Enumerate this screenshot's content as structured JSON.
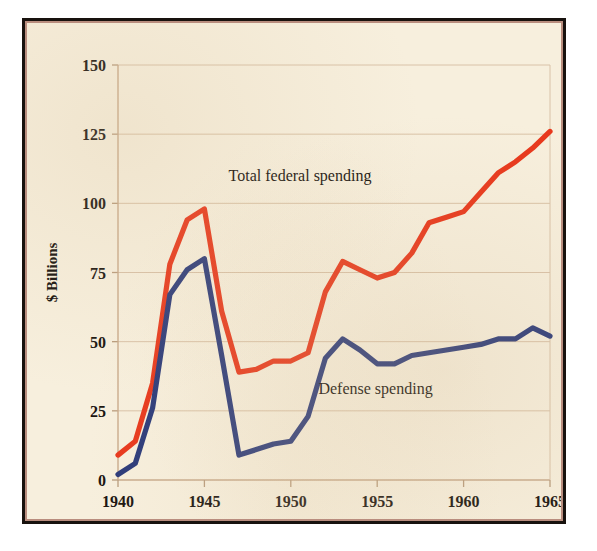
{
  "chart_data": {
    "type": "line",
    "title": "",
    "xlabel": "",
    "ylabel": "$ Billions",
    "xlim": [
      1940,
      1965
    ],
    "ylim": [
      0,
      150
    ],
    "xticks": [
      "1940",
      "1945",
      "1950",
      "1955",
      "1960",
      "1965"
    ],
    "xtick_values": [
      1940,
      1945,
      1950,
      1955,
      1960,
      1965
    ],
    "yticks": [
      "0",
      "25",
      "50",
      "75",
      "100",
      "125",
      "150"
    ],
    "ytick_values": [
      0,
      25,
      50,
      75,
      100,
      125,
      150
    ],
    "grid": true,
    "legend_position": "inline-annotation",
    "x": [
      1940,
      1941,
      1942,
      1943,
      1944,
      1945,
      1946,
      1947,
      1948,
      1949,
      1950,
      1951,
      1952,
      1953,
      1954,
      1955,
      1956,
      1957,
      1958,
      1959,
      1960,
      1961,
      1962,
      1963,
      1964,
      1965
    ],
    "series": [
      {
        "name": "Total federal spending",
        "color": "#e8381c",
        "values": [
          9,
          14,
          35,
          78,
          94,
          98,
          61,
          39,
          40,
          43,
          43,
          46,
          68,
          79,
          76,
          73,
          75,
          82,
          93,
          95,
          97,
          104,
          111,
          115,
          120,
          126
        ]
      },
      {
        "name": "Defense spending",
        "color": "#2b3a7a",
        "values": [
          2,
          6,
          26,
          67,
          76,
          80,
          45,
          9,
          11,
          13,
          14,
          23,
          44,
          51,
          47,
          42,
          42,
          45,
          46,
          47,
          48,
          49,
          51,
          51,
          55,
          52
        ]
      }
    ],
    "annotations": [
      {
        "text": "Total federal spending",
        "x": 1946.4,
        "y": 108
      },
      {
        "text": "Defense spending",
        "x": 1951.6,
        "y": 31
      }
    ]
  },
  "colors": {
    "paper": "#f7efdd",
    "frame": "#18120e",
    "frame_inner": "#b98d7e",
    "grid": "#d9c2a8",
    "total_federal_spending": "#e8381c",
    "defense_spending": "#2b3a7a",
    "text": "#14100c"
  }
}
